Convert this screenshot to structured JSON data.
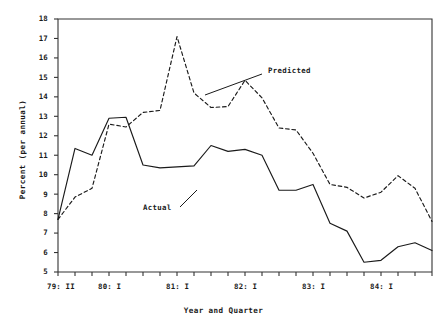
{
  "chart_data": {
    "type": "line",
    "title": "",
    "xlabel": "Year and Quarter",
    "ylabel": "Percent (per annual)",
    "ylim": [
      5,
      18
    ],
    "xlim": [
      0,
      22
    ],
    "grid": false,
    "legend_position": "inline-annotation",
    "y_ticks": [
      5,
      6,
      7,
      8,
      9,
      10,
      11,
      12,
      13,
      14,
      15,
      16,
      17,
      18
    ],
    "y_tick_labels": [
      "5",
      "6",
      "7",
      "8",
      "9",
      "10",
      "11",
      "12",
      "13",
      "14",
      "15",
      "16",
      "17",
      "18"
    ],
    "x_tick_count": 23,
    "x_tick_labels": [
      "79: II",
      "80: I",
      "81: I",
      "82: I",
      "83: I",
      "84: I"
    ],
    "x_tick_label_indices": [
      0,
      3,
      7,
      11,
      15,
      19
    ],
    "categories": [
      "79:II",
      "79:III",
      "79:IV",
      "80:I",
      "80:II",
      "80:III",
      "80:IV",
      "81:I",
      "81:II",
      "81:III",
      "81:IV",
      "82:I",
      "82:II",
      "82:III",
      "82:IV",
      "83:I",
      "83:II",
      "83:III",
      "83:IV",
      "84:I",
      "84:II",
      "84:III",
      "84:IV"
    ],
    "series": [
      {
        "name": "Actual",
        "style": "solid",
        "color": "#1a1a1a",
        "values": [
          7.7,
          11.35,
          11.0,
          12.9,
          12.95,
          10.5,
          10.35,
          10.4,
          10.45,
          11.5,
          11.2,
          11.3,
          11.0,
          9.2,
          9.2,
          9.5,
          7.5,
          7.1,
          5.5,
          5.6,
          6.3,
          6.5,
          6.1
        ]
      },
      {
        "name": "Predicted",
        "style": "dashed",
        "color": "#1a1a1a",
        "values": [
          7.7,
          8.85,
          9.3,
          12.6,
          12.45,
          13.2,
          13.3,
          17.1,
          14.2,
          13.45,
          13.5,
          14.85,
          13.95,
          12.4,
          12.3,
          11.1,
          9.5,
          9.35,
          8.8,
          9.1,
          9.95,
          9.3,
          7.6
        ]
      }
    ],
    "annotations": [
      {
        "name": "Predicted",
        "text": "Predicted",
        "text_x": 268,
        "text_y": 71,
        "leader_from_x": 262,
        "leader_from_y": 74,
        "leader_to_x": 205,
        "leader_to_y": 95
      },
      {
        "name": "Actual",
        "text": "Actual",
        "text_x": 143,
        "text_y": 208,
        "leader_from_x": 180,
        "leader_from_y": 207,
        "leader_to_x": 197,
        "leader_to_y": 190
      }
    ]
  },
  "caption": {
    "partial_text": ""
  }
}
